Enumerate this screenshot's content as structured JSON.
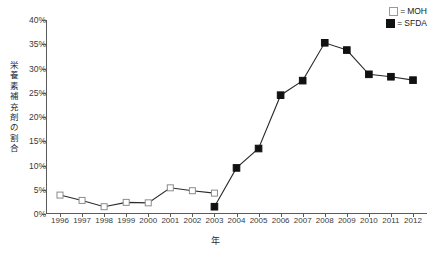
{
  "chart_data": {
    "type": "line",
    "title": "",
    "xlabel": "年",
    "ylabel": "栄養素補充剤の割合",
    "x": [
      1996,
      1997,
      1998,
      1999,
      2000,
      2001,
      2002,
      2003,
      2004,
      2005,
      2006,
      2007,
      2008,
      2009,
      2010,
      2011,
      2012
    ],
    "categories": [
      "1996",
      "1997",
      "1998",
      "1999",
      "2000",
      "2001",
      "2002",
      "2003",
      "2004",
      "2005",
      "2006",
      "2007",
      "2008",
      "2009",
      "2010",
      "2011",
      "2012"
    ],
    "xlim": [
      1996,
      2012
    ],
    "ylim": [
      0,
      40
    ],
    "yticks": [
      0,
      5,
      10,
      15,
      20,
      25,
      30,
      35,
      40
    ],
    "ytick_labels": [
      "0%",
      "5%",
      "10%",
      "15%",
      "20%",
      "25%",
      "30%",
      "35%",
      "40%"
    ],
    "grid": false,
    "legend_position": "top-right",
    "series": [
      {
        "name": "MOH",
        "marker": "open-square",
        "color": "#8c8c8c",
        "x": [
          1996,
          1997,
          1998,
          1999,
          2000,
          2001,
          2002,
          2003
        ],
        "values": [
          3.9,
          2.8,
          1.5,
          2.4,
          2.3,
          5.4,
          4.8,
          4.3
        ]
      },
      {
        "name": "SFDA",
        "marker": "filled-square",
        "color": "#111111",
        "x": [
          2003,
          2004,
          2005,
          2006,
          2007,
          2008,
          2009,
          2010,
          2011,
          2012
        ],
        "values": [
          1.5,
          9.5,
          13.5,
          24.5,
          27.5,
          35.3,
          33.8,
          28.8,
          28.3,
          27.6
        ]
      }
    ]
  },
  "legend": {
    "items": [
      {
        "symbol": "open-square",
        "equals": "=",
        "label": "MOH"
      },
      {
        "symbol": "filled-square",
        "equals": "=",
        "label": "SFDA"
      }
    ]
  },
  "axes": {
    "y_title": "栄養素補充剤の割合",
    "x_title": "年"
  }
}
